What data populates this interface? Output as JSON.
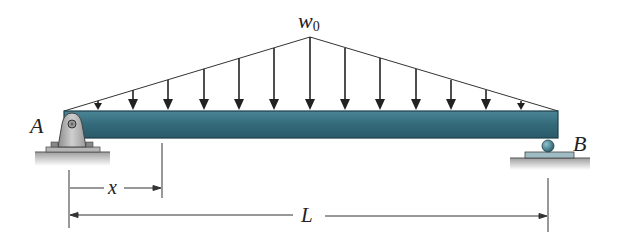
{
  "figure": {
    "type": "simply supported beam with triangular distributed load",
    "load": {
      "label": "w",
      "subscript": "0",
      "shape": "triangular, peak at midspan",
      "arrow_count": 13
    },
    "supports": [
      {
        "label": "A",
        "type": "pin"
      },
      {
        "label": "B",
        "type": "roller"
      }
    ],
    "dimensions": [
      {
        "label": "x",
        "from": "A",
        "to": "section"
      },
      {
        "label": "L",
        "from": "A",
        "to": "B"
      }
    ],
    "colors": {
      "beam": "#2f6474",
      "beam_edge": "#1d3f4a",
      "pin": "#a9a9a9",
      "roller": "#3d7a8c",
      "ground": "#bdbdbd",
      "line": "#222222"
    }
  }
}
